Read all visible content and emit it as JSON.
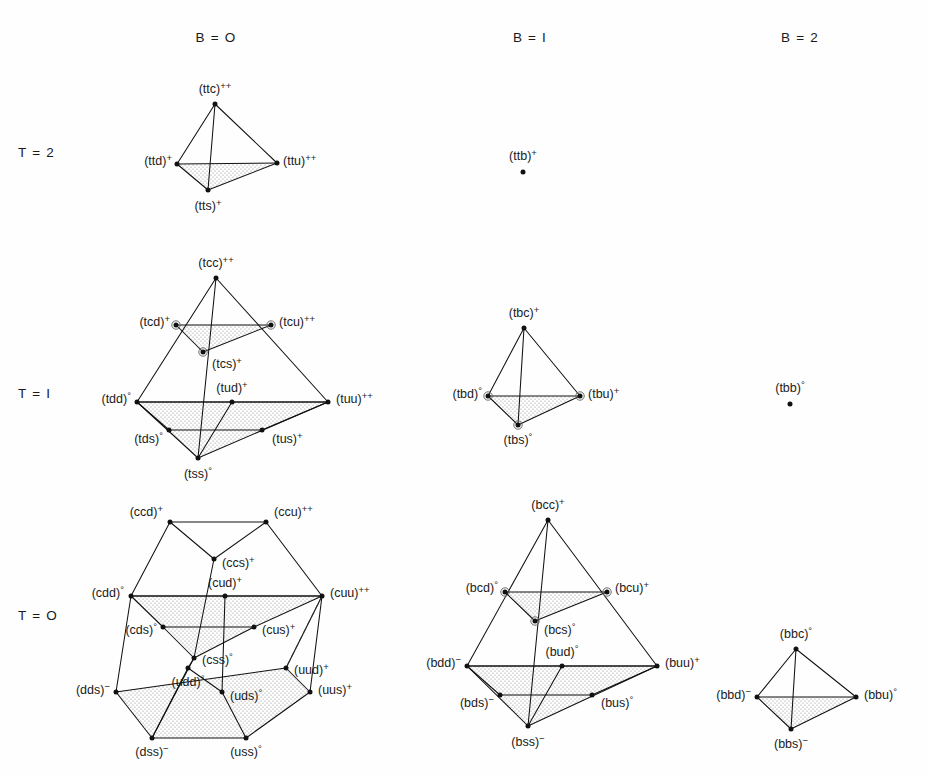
{
  "figure": {
    "title": "",
    "background_color": "#fefefe",
    "line_color": "#111111",
    "shade_color": "#b9b9b9"
  },
  "column_headers": [
    {
      "id": "b0",
      "label": "B = O",
      "x": 216,
      "y": 42
    },
    {
      "id": "b1",
      "label": "B = I",
      "x": 530,
      "y": 42
    },
    {
      "id": "b2",
      "label": "B = 2",
      "x": 800,
      "y": 42
    }
  ],
  "row_headers": [
    {
      "id": "t2",
      "label": "T = 2",
      "x": 18,
      "y": 157
    },
    {
      "id": "t1",
      "label": "T = I",
      "x": 18,
      "y": 398
    },
    {
      "id": "t0",
      "label": "T = O",
      "x": 18,
      "y": 620
    }
  ],
  "groups": [
    {
      "id": "t2b0",
      "name": "t2-b0-tetrahedron",
      "baryon": "B = O",
      "isospin": "T = 2",
      "shape": "tetrahedron",
      "vertices": [
        {
          "id": "ttc",
          "label": "(ttc)",
          "charge": "++",
          "x": 215,
          "y": 104,
          "label_x": 215,
          "label_y": 93,
          "anchor": "middle",
          "ring": false
        },
        {
          "id": "ttd",
          "label": "(ttd)",
          "charge": "+",
          "x": 177,
          "y": 164,
          "label_x": 172,
          "label_y": 165,
          "anchor": "end",
          "ring": false
        },
        {
          "id": "ttu",
          "label": "(ttu)",
          "charge": "++",
          "x": 277,
          "y": 163,
          "label_x": 283,
          "label_y": 165,
          "anchor": "start",
          "ring": false
        },
        {
          "id": "tts",
          "label": "(tts)",
          "charge": "+",
          "x": 208,
          "y": 190,
          "label_x": 208,
          "label_y": 210,
          "anchor": "middle",
          "ring": false
        }
      ],
      "edges": [
        [
          "ttc",
          "ttd"
        ],
        [
          "ttc",
          "ttu"
        ],
        [
          "ttc",
          "tts"
        ],
        [
          "ttd",
          "ttu"
        ],
        [
          "ttd",
          "tts"
        ],
        [
          "ttu",
          "tts"
        ]
      ],
      "shaded_faces": [
        [
          "ttd",
          "ttu",
          "tts"
        ]
      ]
    },
    {
      "id": "t1b0",
      "name": "t1-b0-tetrahedron",
      "baryon": "B = O",
      "isospin": "T = I",
      "shape": "tetrahedron",
      "vertices": [
        {
          "id": "tcc",
          "label": "(tcc)",
          "charge": "++",
          "x": 216,
          "y": 278,
          "label_x": 216,
          "label_y": 267,
          "anchor": "middle",
          "ring": false
        },
        {
          "id": "tcd",
          "label": "(tcd)",
          "charge": "+",
          "x": 176,
          "y": 325,
          "label_x": 170,
          "label_y": 326,
          "anchor": "end",
          "ring": true
        },
        {
          "id": "tcu",
          "label": "(tcu)",
          "charge": "++",
          "x": 271,
          "y": 325,
          "label_x": 279,
          "label_y": 326,
          "anchor": "start",
          "ring": true
        },
        {
          "id": "tcs",
          "label": "(tcs)",
          "charge": "+",
          "x": 203,
          "y": 352,
          "label_x": 212,
          "label_y": 368,
          "anchor": "start",
          "ring": true
        },
        {
          "id": "tdd",
          "label": "(tdd)",
          "charge": "°",
          "x": 137,
          "y": 402,
          "label_x": 131,
          "label_y": 403,
          "anchor": "end",
          "ring": false
        },
        {
          "id": "tuu",
          "label": "(tuu)",
          "charge": "++",
          "x": 328,
          "y": 402,
          "label_x": 336,
          "label_y": 403,
          "anchor": "start",
          "ring": false
        },
        {
          "id": "tud",
          "label": "(tud)",
          "charge": "+",
          "x": 232,
          "y": 402,
          "label_x": 232,
          "label_y": 392,
          "anchor": "middle",
          "ring": false
        },
        {
          "id": "tds",
          "label": "(tds)",
          "charge": "°",
          "x": 169,
          "y": 430,
          "label_x": 163,
          "label_y": 443,
          "anchor": "end",
          "ring": false
        },
        {
          "id": "tus",
          "label": "(tus)",
          "charge": "+",
          "x": 262,
          "y": 430,
          "label_x": 272,
          "label_y": 443,
          "anchor": "start",
          "ring": false
        },
        {
          "id": "tss",
          "label": "(tss)",
          "charge": "°",
          "x": 198,
          "y": 458,
          "label_x": 198,
          "label_y": 478,
          "anchor": "middle",
          "ring": false
        }
      ],
      "edges": [
        [
          "tcc",
          "tdd"
        ],
        [
          "tcc",
          "tuu"
        ],
        [
          "tcc",
          "tss"
        ],
        [
          "tdd",
          "tuu"
        ],
        [
          "tdd",
          "tss"
        ],
        [
          "tuu",
          "tss"
        ],
        [
          "tcd",
          "tcu"
        ],
        [
          "tcd",
          "tcs"
        ],
        [
          "tcu",
          "tcs"
        ],
        [
          "tdd",
          "tud"
        ],
        [
          "tud",
          "tuu"
        ],
        [
          "tds",
          "tus"
        ],
        [
          "tds",
          "tdd"
        ],
        [
          "tus",
          "tuu"
        ],
        [
          "tud",
          "tss"
        ]
      ],
      "shaded_faces": [
        [
          "tcd",
          "tcu",
          "tcs"
        ],
        [
          "tdd",
          "tuu",
          "tss"
        ]
      ]
    },
    {
      "id": "t0b0",
      "name": "t0-b0-hexagonal-prism",
      "baryon": "B = O",
      "isospin": "T = O",
      "shape": "truncated-tetrahedron",
      "vertices": [
        {
          "id": "ccd",
          "label": "(ccd)",
          "charge": "+",
          "x": 170,
          "y": 522,
          "label_x": 163,
          "label_y": 516,
          "anchor": "end",
          "ring": false
        },
        {
          "id": "ccu",
          "label": "(ccu)",
          "charge": "++",
          "x": 266,
          "y": 522,
          "label_x": 274,
          "label_y": 516,
          "anchor": "start",
          "ring": false
        },
        {
          "id": "ccs",
          "label": "(ccs)",
          "charge": "+",
          "x": 214,
          "y": 559,
          "label_x": 222,
          "label_y": 567,
          "anchor": "start",
          "ring": false
        },
        {
          "id": "cdd",
          "label": "(cdd)",
          "charge": "°",
          "x": 131,
          "y": 596,
          "label_x": 124,
          "label_y": 597,
          "anchor": "end",
          "ring": false
        },
        {
          "id": "cuu",
          "label": "(cuu)",
          "charge": "++",
          "x": 322,
          "y": 596,
          "label_x": 330,
          "label_y": 597,
          "anchor": "start",
          "ring": false
        },
        {
          "id": "cud",
          "label": "(cud)",
          "charge": "+",
          "x": 225,
          "y": 596,
          "label_x": 225,
          "label_y": 587,
          "anchor": "middle",
          "ring": false
        },
        {
          "id": "cds",
          "label": "(cds)",
          "charge": "°",
          "x": 163,
          "y": 627,
          "label_x": 157,
          "label_y": 634,
          "anchor": "end",
          "ring": false
        },
        {
          "id": "cus",
          "label": "(cus)",
          "charge": "+",
          "x": 254,
          "y": 627,
          "label_x": 262,
          "label_y": 634,
          "anchor": "start",
          "ring": false
        },
        {
          "id": "css",
          "label": "(css)",
          "charge": "°",
          "x": 194,
          "y": 658,
          "label_x": 202,
          "label_y": 664,
          "anchor": "start",
          "ring": false
        },
        {
          "id": "uud",
          "label": "(uud)",
          "charge": "+",
          "x": 286,
          "y": 668,
          "label_x": 294,
          "label_y": 674,
          "anchor": "start",
          "ring": false
        },
        {
          "id": "udd",
          "label": "(udd)",
          "charge": "°",
          "x": 188,
          "y": 668,
          "label_x": 188,
          "label_y": 686,
          "anchor": "middle",
          "ring": false
        },
        {
          "id": "uds",
          "label": "(uds)",
          "charge": "°",
          "x": 222,
          "y": 692,
          "label_x": 230,
          "label_y": 700,
          "anchor": "start",
          "ring": false
        },
        {
          "id": "dds",
          "label": "(dds)",
          "charge": "−",
          "x": 116,
          "y": 692,
          "label_x": 110,
          "label_y": 694,
          "anchor": "end",
          "ring": false
        },
        {
          "id": "uus",
          "label": "(uus)",
          "charge": "+",
          "x": 310,
          "y": 692,
          "label_x": 318,
          "label_y": 694,
          "anchor": "start",
          "ring": false
        },
        {
          "id": "dss",
          "label": "(dss)",
          "charge": "−",
          "x": 152,
          "y": 738,
          "label_x": 152,
          "label_y": 756,
          "anchor": "middle",
          "ring": false
        },
        {
          "id": "uss",
          "label": "(uss)",
          "charge": "°",
          "x": 246,
          "y": 738,
          "label_x": 246,
          "label_y": 756,
          "anchor": "middle",
          "ring": false
        }
      ],
      "edges": [
        [
          "ccd",
          "ccu"
        ],
        [
          "ccd",
          "cdd"
        ],
        [
          "ccu",
          "cuu"
        ],
        [
          "ccd",
          "ccs"
        ],
        [
          "ccu",
          "ccs"
        ],
        [
          "ccs",
          "css"
        ],
        [
          "cdd",
          "cuu"
        ],
        [
          "cdd",
          "cds"
        ],
        [
          "cds",
          "css"
        ],
        [
          "cuu",
          "cus"
        ],
        [
          "cus",
          "css"
        ],
        [
          "cdd",
          "cud"
        ],
        [
          "cud",
          "cuu"
        ],
        [
          "cud",
          "uds"
        ],
        [
          "cds",
          "cus"
        ],
        [
          "cdd",
          "dds"
        ],
        [
          "cuu",
          "uus"
        ],
        [
          "cuu",
          "uud"
        ],
        [
          "dds",
          "dss"
        ],
        [
          "uus",
          "uss"
        ],
        [
          "dss",
          "uss"
        ],
        [
          "dds",
          "uud"
        ],
        [
          "uud",
          "uus"
        ],
        [
          "udd",
          "uds"
        ],
        [
          "udd",
          "css"
        ],
        [
          "uds",
          "uss"
        ],
        [
          "udd",
          "dss"
        ],
        [
          "css",
          "dss"
        ]
      ],
      "dashed_edges": [
        [
          "cuu",
          "uud"
        ]
      ],
      "shaded_faces": [
        [
          "cdd",
          "cuu",
          "cus",
          "css",
          "cds"
        ],
        [
          "dds",
          "uud",
          "uus",
          "uss",
          "dss"
        ]
      ]
    },
    {
      "id": "t2b1",
      "name": "t2-b1-single-point",
      "baryon": "B = I",
      "isospin": "T = 2",
      "shape": "point",
      "vertices": [
        {
          "id": "ttb",
          "label": "(ttb)",
          "charge": "+",
          "x": 523,
          "y": 172,
          "label_x": 523,
          "label_y": 160,
          "anchor": "middle",
          "ring": false
        }
      ],
      "edges": [],
      "shaded_faces": []
    },
    {
      "id": "t1b1",
      "name": "t1-b1-tetrahedron",
      "baryon": "B = I",
      "isospin": "T = I",
      "shape": "tetrahedron",
      "vertices": [
        {
          "id": "tbc",
          "label": "(tbc)",
          "charge": "+",
          "x": 524,
          "y": 328,
          "label_x": 524,
          "label_y": 317,
          "anchor": "middle",
          "ring": false
        },
        {
          "id": "tbd",
          "label": "(tbd)",
          "charge": "°",
          "x": 488,
          "y": 396,
          "label_x": 482,
          "label_y": 398,
          "anchor": "end",
          "ring": true
        },
        {
          "id": "tbu",
          "label": "(tbu)",
          "charge": "+",
          "x": 580,
          "y": 396,
          "label_x": 588,
          "label_y": 398,
          "anchor": "start",
          "ring": true
        },
        {
          "id": "tbs",
          "label": "(tbs)",
          "charge": "°",
          "x": 518,
          "y": 425,
          "label_x": 518,
          "label_y": 444,
          "anchor": "middle",
          "ring": true
        }
      ],
      "edges": [
        [
          "tbc",
          "tbd"
        ],
        [
          "tbc",
          "tbu"
        ],
        [
          "tbc",
          "tbs"
        ],
        [
          "tbd",
          "tbu"
        ],
        [
          "tbd",
          "tbs"
        ],
        [
          "tbu",
          "tbs"
        ]
      ],
      "shaded_faces": [
        [
          "tbd",
          "tbu",
          "tbs"
        ]
      ]
    },
    {
      "id": "t0b1",
      "name": "t0-b1-tetrahedron",
      "baryon": "B = I",
      "isospin": "T = O",
      "shape": "tetrahedron",
      "vertices": [
        {
          "id": "bcc",
          "label": "(bcc)",
          "charge": "+",
          "x": 548,
          "y": 520,
          "label_x": 548,
          "label_y": 509,
          "anchor": "middle",
          "ring": false
        },
        {
          "id": "bcd",
          "label": "(bcd)",
          "charge": "°",
          "x": 505,
          "y": 592,
          "label_x": 498,
          "label_y": 592,
          "anchor": "end",
          "ring": true
        },
        {
          "id": "bcu",
          "label": "(bcu)",
          "charge": "+",
          "x": 607,
          "y": 592,
          "label_x": 615,
          "label_y": 592,
          "anchor": "start",
          "ring": true
        },
        {
          "id": "bcs",
          "label": "(bcs)",
          "charge": "°",
          "x": 535,
          "y": 621,
          "label_x": 544,
          "label_y": 634,
          "anchor": "start",
          "ring": true
        },
        {
          "id": "bdd",
          "label": "(bdd)",
          "charge": "−",
          "x": 467,
          "y": 666,
          "label_x": 461,
          "label_y": 667,
          "anchor": "end",
          "ring": false
        },
        {
          "id": "buu",
          "label": "(buu)",
          "charge": "+",
          "x": 657,
          "y": 666,
          "label_x": 665,
          "label_y": 667,
          "anchor": "start",
          "ring": false
        },
        {
          "id": "bud",
          "label": "(bud)",
          "charge": "°",
          "x": 562,
          "y": 666,
          "label_x": 562,
          "label_y": 656,
          "anchor": "middle",
          "ring": false
        },
        {
          "id": "bds",
          "label": "(bds)",
          "charge": "−",
          "x": 500,
          "y": 695,
          "label_x": 494,
          "label_y": 707,
          "anchor": "end",
          "ring": false
        },
        {
          "id": "bus",
          "label": "(bus)",
          "charge": "°",
          "x": 592,
          "y": 695,
          "label_x": 601,
          "label_y": 707,
          "anchor": "start",
          "ring": false
        },
        {
          "id": "bss",
          "label": "(bss)",
          "charge": "−",
          "x": 528,
          "y": 726,
          "label_x": 528,
          "label_y": 746,
          "anchor": "middle",
          "ring": false
        }
      ],
      "edges": [
        [
          "bcc",
          "bdd"
        ],
        [
          "bcc",
          "buu"
        ],
        [
          "bcc",
          "bss"
        ],
        [
          "bdd",
          "buu"
        ],
        [
          "bdd",
          "bss"
        ],
        [
          "buu",
          "bss"
        ],
        [
          "bcd",
          "bcu"
        ],
        [
          "bcd",
          "bcs"
        ],
        [
          "bcu",
          "bcs"
        ],
        [
          "bdd",
          "bud"
        ],
        [
          "bud",
          "buu"
        ],
        [
          "bds",
          "bus"
        ],
        [
          "bds",
          "bdd"
        ],
        [
          "bus",
          "buu"
        ],
        [
          "bud",
          "bss"
        ]
      ],
      "shaded_faces": [
        [
          "bcd",
          "bcu",
          "bcs"
        ],
        [
          "bdd",
          "buu",
          "bss"
        ]
      ]
    },
    {
      "id": "t1b2",
      "name": "t1-b2-single-point",
      "baryon": "B = 2",
      "isospin": "T = I",
      "shape": "point",
      "vertices": [
        {
          "id": "tbb",
          "label": "(tbb)",
          "charge": "°",
          "x": 790,
          "y": 404,
          "label_x": 790,
          "label_y": 392,
          "anchor": "middle",
          "ring": false
        }
      ],
      "edges": [],
      "shaded_faces": []
    },
    {
      "id": "t0b2",
      "name": "t0-b2-tetrahedron",
      "baryon": "B = 2",
      "isospin": "T = O",
      "shape": "tetrahedron",
      "vertices": [
        {
          "id": "bbc",
          "label": "(bbc)",
          "charge": "°",
          "x": 796,
          "y": 649,
          "label_x": 796,
          "label_y": 638,
          "anchor": "middle",
          "ring": false
        },
        {
          "id": "bbd",
          "label": "(bbd)",
          "charge": "−",
          "x": 757,
          "y": 697,
          "label_x": 751,
          "label_y": 699,
          "anchor": "end",
          "ring": false
        },
        {
          "id": "bbu",
          "label": "(bbu)",
          "charge": "°",
          "x": 856,
          "y": 697,
          "label_x": 864,
          "label_y": 699,
          "anchor": "start",
          "ring": false
        },
        {
          "id": "bbs",
          "label": "(bbs)",
          "charge": "−",
          "x": 791,
          "y": 729,
          "label_x": 791,
          "label_y": 748,
          "anchor": "middle",
          "ring": false
        }
      ],
      "edges": [
        [
          "bbc",
          "bbd"
        ],
        [
          "bbc",
          "bbu"
        ],
        [
          "bbc",
          "bbs"
        ],
        [
          "bbd",
          "bbu"
        ],
        [
          "bbd",
          "bbs"
        ],
        [
          "bbu",
          "bbs"
        ]
      ],
      "shaded_faces": [
        [
          "bbd",
          "bbu",
          "bbs"
        ]
      ]
    }
  ]
}
